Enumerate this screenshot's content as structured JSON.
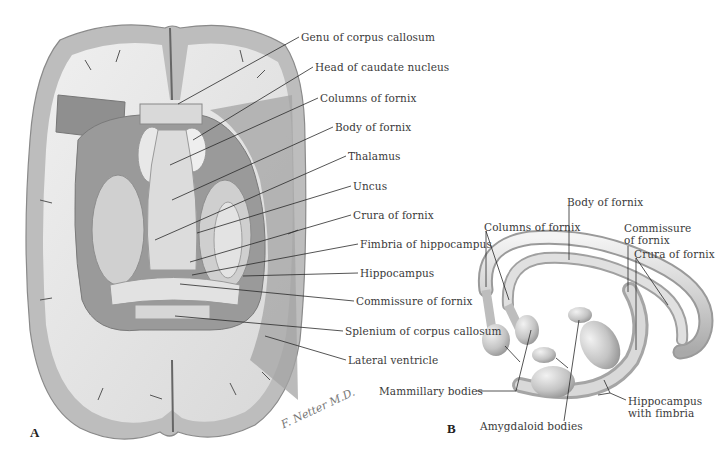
{
  "figure": {
    "panels": [
      "A",
      "B"
    ],
    "signature": "F. Netter M.D."
  },
  "panel_a": {
    "labels": [
      {
        "text": "Genu of corpus callosum",
        "x": 301,
        "y": 30,
        "tx": 178,
        "ty": 104
      },
      {
        "text": "Head of caudate nucleus",
        "x": 315,
        "y": 60,
        "tx": 193,
        "ty": 140
      },
      {
        "text": "Columns of fornix",
        "x": 320,
        "y": 91,
        "tx": 170,
        "ty": 165
      },
      {
        "text": "Body of fornix",
        "x": 335,
        "y": 120,
        "tx": 172,
        "ty": 200
      },
      {
        "text": "Thalamus",
        "x": 348,
        "y": 149,
        "tx": 155,
        "ty": 240
      },
      {
        "text": "Uncus",
        "x": 353,
        "y": 180,
        "tx": 197,
        "ty": 233
      },
      {
        "text": "Crura of fornix",
        "x": 353,
        "y": 209,
        "tx": 190,
        "ty": 262
      },
      {
        "text": "Fimbria of hippocampus",
        "x": 360,
        "y": 238,
        "tx": 192,
        "ty": 275
      },
      {
        "text": "Hippocampus",
        "x": 360,
        "y": 267,
        "tx": 243,
        "ty": 276
      },
      {
        "text": "Commissure of fornix",
        "x": 356,
        "y": 295,
        "tx": 180,
        "ty": 284
      },
      {
        "text": "Splenium of corpus callosum",
        "x": 345,
        "y": 325,
        "tx": 175,
        "ty": 316
      },
      {
        "text": "Lateral ventricle",
        "x": 348,
        "y": 354,
        "tx": 265,
        "ty": 336
      }
    ]
  },
  "panel_b": {
    "labels": [
      {
        "text": "Body of fornix",
        "x": 567,
        "y": 196
      },
      {
        "text": "Columns of fornix",
        "x": 484,
        "y": 221
      },
      {
        "text": "Commissure",
        "x": 624,
        "y": 222
      },
      {
        "text": "of fornix",
        "x": 624,
        "y": 234
      },
      {
        "text": "Crura of fornix",
        "x": 634,
        "y": 248
      },
      {
        "text": "Mammillary bodies",
        "x": 379,
        "y": 385
      },
      {
        "text": "Hippocampus",
        "x": 628,
        "y": 395
      },
      {
        "text": "with fimbria",
        "x": 628,
        "y": 407
      },
      {
        "text": "Amygdaloid bodies",
        "x": 480,
        "y": 420
      }
    ]
  },
  "colors": {
    "background": "#ffffff",
    "cortex_gray": "#b9b9b9",
    "white_matter": "#e6e6e6",
    "dark_section": "#8f8f8f",
    "leader_line": "#2a2a2a",
    "label_text": "#3a3a3a"
  }
}
